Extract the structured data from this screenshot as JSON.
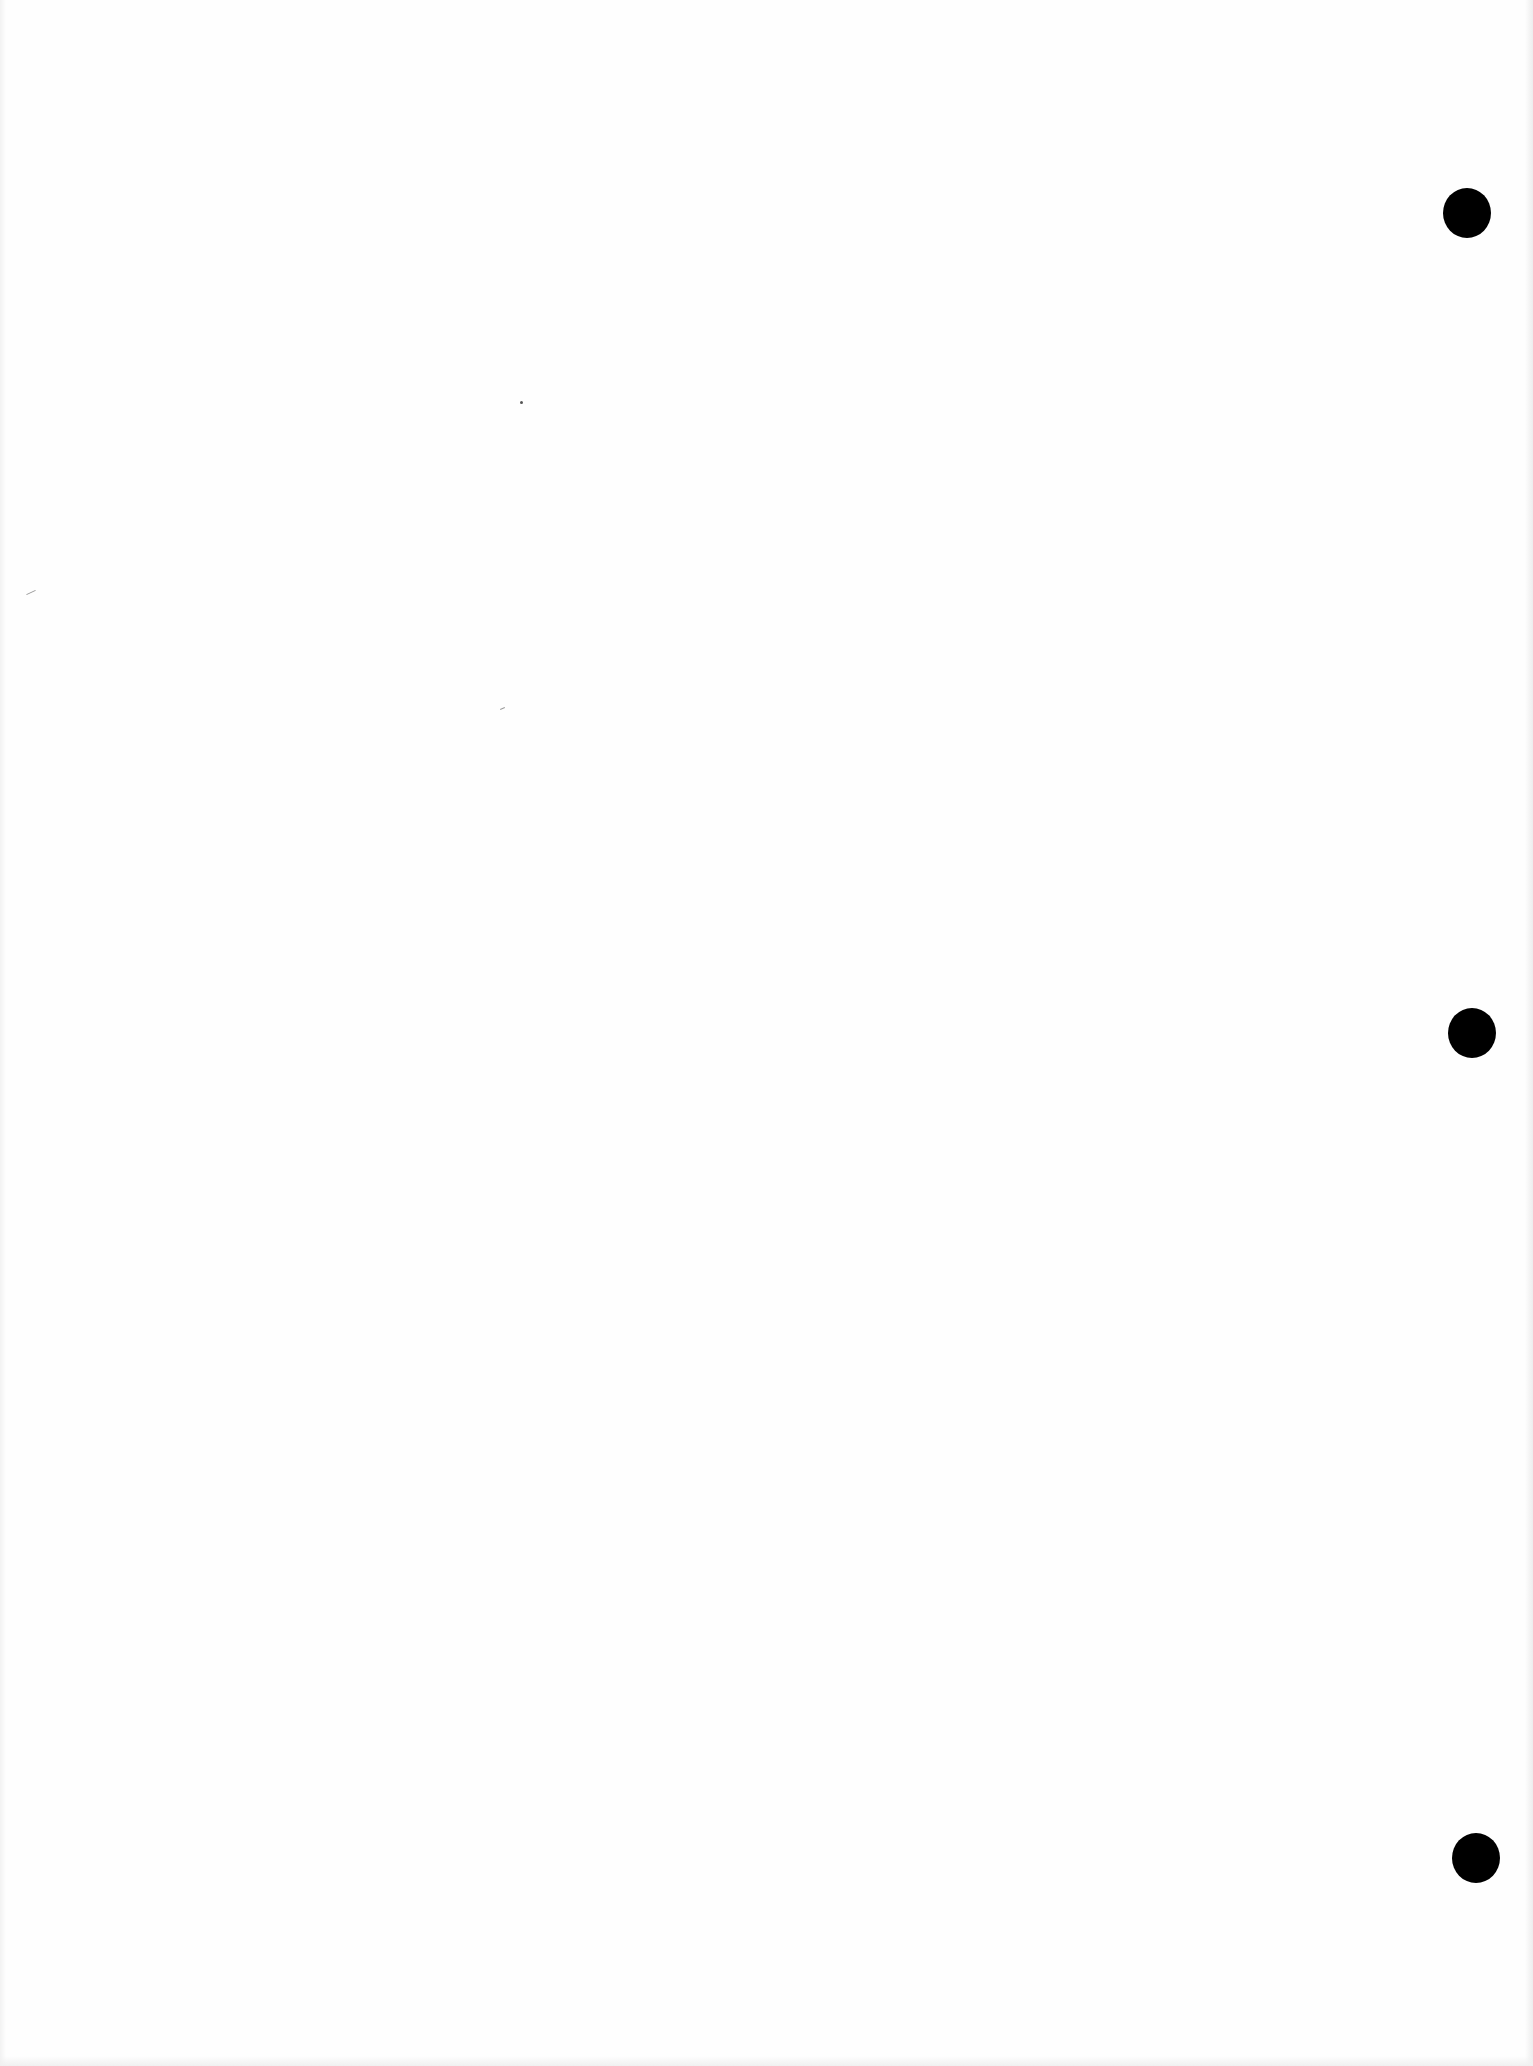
{
  "page": {
    "type": "blank scanned page",
    "background_color": "#fefefe",
    "text_content": ""
  },
  "punch_holes": [
    {
      "label": "top-punch-hole",
      "cx": 1467,
      "cy": 213
    },
    {
      "label": "middle-punch-hole",
      "cx": 1472,
      "cy": 1033
    },
    {
      "label": "bottom-punch-hole",
      "cx": 1476,
      "cy": 1858
    }
  ],
  "colors": {
    "paper": "#fefefe",
    "hole": "#000000"
  }
}
